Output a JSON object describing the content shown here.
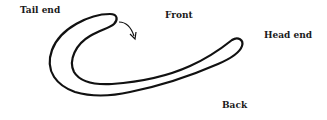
{
  "diagram": {
    "labels": {
      "tail": "Tail end",
      "front": "Front",
      "head": "Head end",
      "back": "Back"
    },
    "arrow": "curved-arrow-pointing-down-from-tail-tip",
    "stroke_color": "#111111"
  }
}
